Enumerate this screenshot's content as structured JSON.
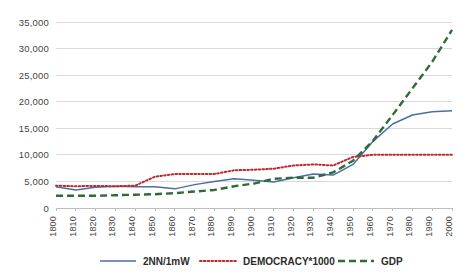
{
  "chart_data": {
    "type": "line",
    "title": "",
    "subtitle": "",
    "xlabel": "",
    "ylabel": "",
    "x": [
      1800,
      1810,
      1820,
      1830,
      1840,
      1850,
      1860,
      1870,
      1880,
      1890,
      1900,
      1910,
      1920,
      1930,
      1940,
      1950,
      1960,
      1970,
      1980,
      1990,
      2000
    ],
    "categories": [
      "1800",
      "1810",
      "1820",
      "1830",
      "1840",
      "1850",
      "1860",
      "1870",
      "1880",
      "1890",
      "1900",
      "1910",
      "1920",
      "1930",
      "1940",
      "1950",
      "1960",
      "1970",
      "1980",
      "1990",
      "2000"
    ],
    "xlim": [
      1800,
      2000
    ],
    "ylim": [
      0,
      35000
    ],
    "ytick_values": [
      0,
      5000,
      10000,
      15000,
      20000,
      25000,
      30000,
      35000
    ],
    "ytick_labels": [
      "0",
      "5,000",
      "10,000",
      "15,000",
      "20,000",
      "25,000",
      "30,000",
      "35,000"
    ],
    "grid": true,
    "legend_position": "bottom",
    "series": [
      {
        "name": "2NN/1mW",
        "color": "#4a6fa5",
        "style": "solid",
        "values": [
          4000,
          3400,
          3900,
          4100,
          4000,
          4000,
          3600,
          4400,
          5000,
          5500,
          5200,
          4900,
          5700,
          6400,
          6200,
          8200,
          12500,
          15800,
          17500,
          18100,
          18300
        ]
      },
      {
        "name": "DEMOCRACY*1000",
        "color": "#c0282d",
        "style": "dotted",
        "values": [
          4200,
          4100,
          4150,
          4100,
          4200,
          5900,
          6400,
          6400,
          6400,
          7100,
          7200,
          7400,
          8000,
          8200,
          8000,
          9600,
          10000,
          10000,
          10000,
          10000,
          10000
        ]
      },
      {
        "name": "GDP",
        "color": "#2f6b35",
        "style": "dashed",
        "values": [
          2300,
          2300,
          2300,
          2400,
          2500,
          2600,
          2800,
          3100,
          3400,
          4100,
          4600,
          5500,
          5700,
          5700,
          6700,
          8900,
          12600,
          17500,
          22500,
          27500,
          33500
        ]
      }
    ]
  },
  "legend": {
    "items": [
      {
        "label": "2NN/1mW",
        "color": "#4a6fa5",
        "style": "solid"
      },
      {
        "label": "DEMOCRACY*1000",
        "color": "#c0282d",
        "style": "dotted"
      },
      {
        "label": "GDP",
        "color": "#2f6b35",
        "style": "dashed"
      }
    ]
  },
  "colors": {
    "series_blue": "#4a6fa5",
    "series_red": "#c0282d",
    "series_green": "#2f6b35",
    "grid": "#d9d9d9",
    "background": "#ffffff",
    "text": "#3b3b3b"
  }
}
